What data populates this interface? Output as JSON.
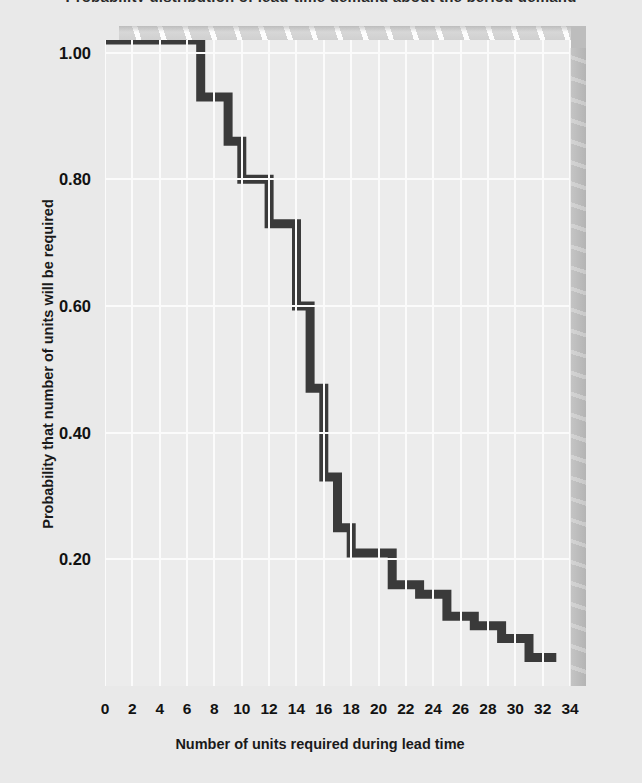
{
  "chart_data": {
    "type": "line",
    "subtype": "step-decreasing",
    "title": "Probability distribution of lead-time demand about the period demand",
    "xlabel": "Number of units required during lead time",
    "ylabel": "Probability that number of units will be required",
    "xlim": [
      0,
      34
    ],
    "ylim": [
      0.0,
      1.02
    ],
    "x_ticks": [
      0,
      2,
      4,
      6,
      8,
      10,
      12,
      14,
      16,
      18,
      20,
      22,
      24,
      26,
      28,
      30,
      32,
      34
    ],
    "y_ticks": [
      0.2,
      0.4,
      0.6,
      0.8,
      1.0
    ],
    "y_tick_labels": [
      "0.20",
      "0.40",
      "0.60",
      "0.80",
      "1.00"
    ],
    "grid": true,
    "legend": false,
    "line_color": "#3a3a3a",
    "plot_background": "#ececec",
    "page_background": "#e9e9e9",
    "x": [
      0,
      7,
      8,
      9,
      10,
      11,
      12,
      13,
      14,
      15,
      16,
      17,
      18,
      19,
      20,
      21,
      22,
      24,
      26,
      28,
      30,
      32,
      33
    ],
    "y": [
      1.02,
      1.02,
      0.93,
      0.93,
      0.86,
      0.8,
      0.8,
      0.73,
      0.73,
      0.6,
      0.47,
      0.33,
      0.25,
      0.21,
      0.21,
      0.21,
      0.16,
      0.145,
      0.11,
      0.095,
      0.075,
      0.045,
      0.045
    ],
    "steps": [
      {
        "x_start": 0,
        "x_end": 7,
        "value": 1.02
      },
      {
        "x_start": 7,
        "x_end": 9,
        "value": 0.93
      },
      {
        "x_start": 9,
        "x_end": 10,
        "value": 0.86
      },
      {
        "x_start": 10,
        "x_end": 12,
        "value": 0.8
      },
      {
        "x_start": 12,
        "x_end": 14,
        "value": 0.73
      },
      {
        "x_start": 14,
        "x_end": 15,
        "value": 0.6
      },
      {
        "x_start": 15,
        "x_end": 16,
        "value": 0.47
      },
      {
        "x_start": 16,
        "x_end": 17,
        "value": 0.33
      },
      {
        "x_start": 17,
        "x_end": 18,
        "value": 0.25
      },
      {
        "x_start": 18,
        "x_end": 21,
        "value": 0.21
      },
      {
        "x_start": 21,
        "x_end": 23,
        "value": 0.16
      },
      {
        "x_start": 23,
        "x_end": 25,
        "value": 0.145
      },
      {
        "x_start": 25,
        "x_end": 27,
        "value": 0.11
      },
      {
        "x_start": 27,
        "x_end": 29,
        "value": 0.095
      },
      {
        "x_start": 29,
        "x_end": 31,
        "value": 0.075
      },
      {
        "x_start": 31,
        "x_end": 33,
        "value": 0.045
      }
    ]
  }
}
